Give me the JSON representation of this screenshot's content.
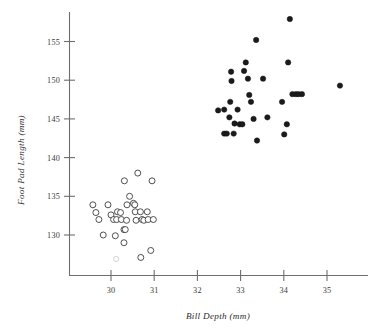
{
  "chart_data": {
    "type": "scatter",
    "title": "",
    "xlabel": "Bill Depth (mm)",
    "ylabel": "Foot Pad Length (mm)",
    "xlim": [
      29.35,
      35.95
    ],
    "ylim": [
      126.8,
      158.6
    ],
    "xticks": [
      30,
      31,
      32,
      33,
      34,
      35
    ],
    "yticks": [
      130,
      135,
      140,
      145,
      150,
      155
    ],
    "xtick_labels": [
      "30",
      "31",
      "32",
      "33",
      "34",
      "35"
    ],
    "ytick_labels": [
      "130",
      "135",
      "140",
      "145",
      "150",
      "155"
    ],
    "grid": false,
    "legend": "none",
    "series": [
      {
        "name": "open-circles-group",
        "marker": "open-circle",
        "marker_color": "#3c3c3c",
        "fill_color": "#ffffff",
        "points": [
          [
            29.58,
            133.9
          ],
          [
            29.65,
            132.9
          ],
          [
            29.72,
            132.0
          ],
          [
            29.82,
            130.0
          ],
          [
            29.93,
            133.9
          ],
          [
            30.0,
            132.6
          ],
          [
            30.06,
            132.0
          ],
          [
            30.13,
            132.0
          ],
          [
            30.15,
            133.0
          ],
          [
            30.22,
            132.9
          ],
          [
            30.24,
            132.0
          ],
          [
            30.1,
            129.9
          ],
          [
            30.3,
            130.7
          ],
          [
            30.33,
            130.7
          ],
          [
            30.3,
            129.0
          ],
          [
            30.31,
            137.0
          ],
          [
            30.37,
            133.9
          ],
          [
            30.36,
            131.9
          ],
          [
            30.43,
            135.0
          ],
          [
            30.52,
            134.1
          ],
          [
            30.55,
            133.9
          ],
          [
            30.56,
            133.0
          ],
          [
            30.58,
            131.9
          ],
          [
            30.62,
            138.0
          ],
          [
            30.68,
            133.0
          ],
          [
            30.72,
            132.0
          ],
          [
            30.76,
            131.9
          ],
          [
            30.84,
            133.0
          ],
          [
            30.86,
            132.0
          ],
          [
            30.69,
            127.1
          ],
          [
            30.95,
            137.0
          ],
          [
            30.98,
            132.0
          ],
          [
            30.92,
            128.0
          ]
        ]
      },
      {
        "name": "filled-circles-group",
        "marker": "filled-circle",
        "marker_color": "#1b1b1b",
        "fill_color": "#1b1b1b",
        "points": [
          [
            32.48,
            146.1
          ],
          [
            32.62,
            146.2
          ],
          [
            32.62,
            143.1
          ],
          [
            32.68,
            143.1
          ],
          [
            32.74,
            145.2
          ],
          [
            32.76,
            147.2
          ],
          [
            32.78,
            151.1
          ],
          [
            32.79,
            149.9
          ],
          [
            32.84,
            143.1
          ],
          [
            32.86,
            144.4
          ],
          [
            32.93,
            146.2
          ],
          [
            32.98,
            144.3
          ],
          [
            33.04,
            144.3
          ],
          [
            33.08,
            151.2
          ],
          [
            33.12,
            152.3
          ],
          [
            33.17,
            150.2
          ],
          [
            33.2,
            148.1
          ],
          [
            33.24,
            147.2
          ],
          [
            33.3,
            145.0
          ],
          [
            33.36,
            155.2
          ],
          [
            33.38,
            142.2
          ],
          [
            33.52,
            150.2
          ],
          [
            33.62,
            145.2
          ],
          [
            33.96,
            147.2
          ],
          [
            34.01,
            143.0
          ],
          [
            34.07,
            144.3
          ],
          [
            34.1,
            152.3
          ],
          [
            34.14,
            157.9
          ],
          [
            34.2,
            148.2
          ],
          [
            34.28,
            148.2
          ],
          [
            34.34,
            148.2
          ],
          [
            34.42,
            148.2
          ],
          [
            35.3,
            149.3
          ]
        ]
      }
    ],
    "clipped_marker_note": {
      "name": "faint-clipped-circle",
      "marker": "open-circle-faint",
      "point": [
        30.12,
        126.9
      ]
    }
  }
}
